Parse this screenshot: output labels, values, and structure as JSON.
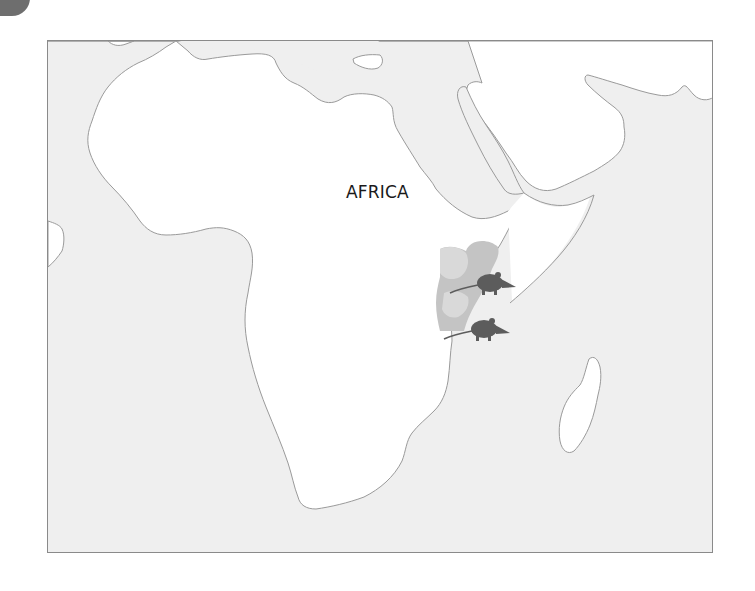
{
  "figure": {
    "badge": {
      "shape": "rounded-corner-tab",
      "color": "#6e6e6e"
    },
    "map": {
      "continent_label": "AFRICA",
      "colors": {
        "ocean": "#efefef",
        "land": "#ffffff",
        "coastline": "#9a9a9a",
        "range_fill": "#c4c4c4",
        "range_fill_faded": "#dcdcdc",
        "animal_silhouette": "#5c5c5c",
        "frame_border": "#8a8a8a"
      },
      "highlighted_range": {
        "description": "shaded distribution range in East Africa",
        "region": "East Africa (Kenya / Tanzania coast)"
      },
      "markers": [
        {
          "icon": "elephant-shrew-icon",
          "position": "upper"
        },
        {
          "icon": "elephant-shrew-icon",
          "position": "lower"
        }
      ],
      "landmasses": [
        "Africa",
        "Madagascar",
        "Arabian Peninsula",
        "Southern Europe",
        "Iberian fragment"
      ]
    }
  }
}
